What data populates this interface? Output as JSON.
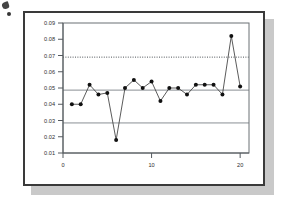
{
  "panel": {
    "border_color": "#3a3a3a",
    "shadow_color": "#c9c9c9",
    "background": "#ffffff"
  },
  "artifact": {
    "name": "scan-ink-mark",
    "color": "#2b2b2b"
  },
  "chart_data": {
    "type": "line",
    "title": "",
    "subtitle": "",
    "xlabel": "",
    "ylabel": "",
    "x": [
      1,
      2,
      3,
      4,
      5,
      6,
      7,
      8,
      9,
      10,
      11,
      12,
      13,
      14,
      15,
      16,
      17,
      18,
      19,
      20
    ],
    "values": [
      0.04,
      0.04,
      0.052,
      0.046,
      0.047,
      0.018,
      0.05,
      0.055,
      0.05,
      0.054,
      0.042,
      0.05,
      0.05,
      0.046,
      0.052,
      0.052,
      0.052,
      0.046,
      0.082,
      0.051
    ],
    "series": [
      {
        "name": "individual-value",
        "values": [
          0.04,
          0.04,
          0.052,
          0.046,
          0.047,
          0.018,
          0.05,
          0.055,
          0.05,
          0.054,
          0.042,
          0.05,
          0.05,
          0.046,
          0.052,
          0.052,
          0.052,
          0.046,
          0.082,
          0.051
        ],
        "line_color": "#3d3d3d",
        "marker_color": "#111111",
        "marker": "circle"
      }
    ],
    "xlim": [
      0,
      21
    ],
    "ylim": [
      0.01,
      0.09
    ],
    "xticks": [
      0,
      10,
      20
    ],
    "xtick_labels": [
      "0",
      "10",
      "20"
    ],
    "yticks": [
      0.01,
      0.02,
      0.03,
      0.04,
      0.05,
      0.06,
      0.07,
      0.08,
      0.09
    ],
    "ytick_labels": [
      "0.01",
      "0.02",
      "0.03",
      "0.04",
      "0.05",
      "0.06",
      "0.07",
      "0.08",
      "0.09"
    ],
    "grid": false,
    "legend": false,
    "legend_position": "none",
    "reference_lines": [
      {
        "name": "upper-control-limit",
        "value": 0.069,
        "style": "dotted",
        "color": "#4d5256"
      },
      {
        "name": "center-line",
        "value": 0.0487,
        "style": "solid",
        "color": "#8a8f94"
      },
      {
        "name": "lower-control-limit",
        "value": 0.0285,
        "style": "solid",
        "color": "#8a8f94"
      }
    ],
    "out_of_control_points": [
      {
        "x": 6,
        "y": 0.018,
        "rule": "below-lower-control-limit"
      },
      {
        "x": 19,
        "y": 0.082,
        "rule": "above-upper-control-limit"
      }
    ]
  }
}
